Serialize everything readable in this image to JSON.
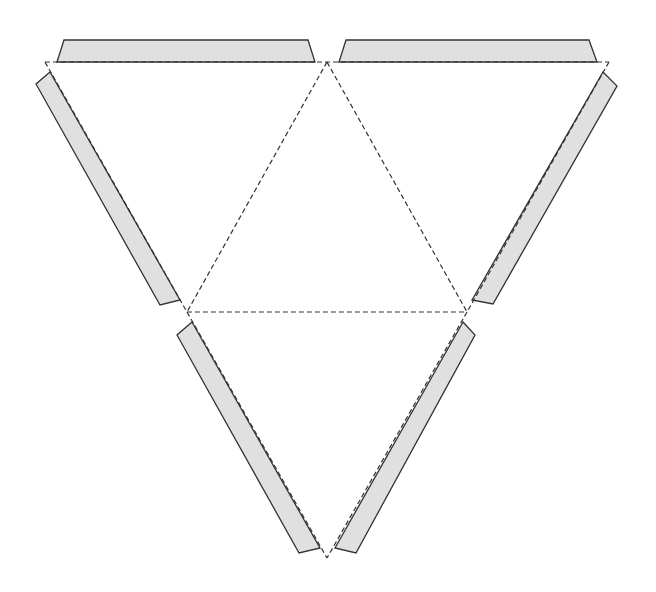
{
  "diagram": {
    "title": "",
    "colors": {
      "background": "#ffffff",
      "flap_fill": "#e0e0e0",
      "stroke": "#333333"
    },
    "vertices": {
      "top_left": [
        45,
        62
      ],
      "top_middle": [
        327,
        62
      ],
      "top_right": [
        609,
        62
      ],
      "middle_left": [
        187,
        312
      ],
      "middle_right": [
        467,
        312
      ],
      "bottom": [
        327,
        558
      ]
    },
    "fold_lines": [
      {
        "name": "top-edge",
        "points": "45,62 609,62"
      },
      {
        "name": "left-outer-upper",
        "points": "45,62 187,312"
      },
      {
        "name": "right-outer-upper",
        "points": "609,62 467,312"
      },
      {
        "name": "inner-left",
        "points": "327,62 187,312"
      },
      {
        "name": "inner-right",
        "points": "327,62 467,312"
      },
      {
        "name": "middle-horizontal",
        "points": "187,312 467,312"
      },
      {
        "name": "left-outer-lower",
        "points": "187,312 327,558"
      },
      {
        "name": "right-outer-lower",
        "points": "467,312 327,558"
      }
    ],
    "flaps": [
      {
        "name": "top-left-tab",
        "points": "57,62 64,40 308,40 315,62"
      },
      {
        "name": "top-right-tab",
        "points": "339,62 346,40 589,40 597,62"
      },
      {
        "name": "left-upper-tab",
        "points": "50,72 36,84 160,305 180,300"
      },
      {
        "name": "right-upper-tab",
        "points": "603,72 617,86 493,304 472,300"
      },
      {
        "name": "left-lower-tab",
        "points": "192,322 177,335 299,553 320,548"
      },
      {
        "name": "right-lower-tab",
        "points": "463,322 475,335 356,553 335,548"
      }
    ],
    "faces": [
      {
        "name": "face-top-left",
        "points": "45,62 327,62 187,312"
      },
      {
        "name": "face-center",
        "points": "327,62 467,312 187,312"
      },
      {
        "name": "face-top-right",
        "points": "327,62 609,62 467,312"
      },
      {
        "name": "face-bottom",
        "points": "187,312 467,312 327,558"
      }
    ]
  }
}
